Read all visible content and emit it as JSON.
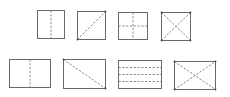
{
  "diagram": {
    "stroke_color": "#6a6a6a",
    "dash_color": "#7a7a7a",
    "shapes": [
      {
        "id": "square-vertical-fold",
        "row": 1,
        "x": 37,
        "y": 10,
        "w": 27,
        "h": 28,
        "folds": [
          [
            0.5,
            0,
            0.5,
            1
          ]
        ],
        "dots": []
      },
      {
        "id": "square-diagonal-fold",
        "row": 1,
        "x": 77,
        "y": 11,
        "w": 28,
        "h": 28,
        "folds": [
          [
            0,
            1,
            1,
            0
          ]
        ],
        "dots": [
          [
            0,
            1
          ],
          [
            1,
            0
          ]
        ]
      },
      {
        "id": "square-cross-fold",
        "row": 1,
        "x": 118,
        "y": 12,
        "w": 29,
        "h": 27,
        "folds": [
          [
            0.5,
            0,
            0.5,
            1
          ],
          [
            0,
            0.5,
            1,
            0.5
          ]
        ],
        "dots": []
      },
      {
        "id": "square-double-diagonal-fold",
        "row": 1,
        "x": 161,
        "y": 12,
        "w": 29,
        "h": 28,
        "folds": [
          [
            0,
            0,
            1,
            1
          ],
          [
            0,
            1,
            1,
            0
          ]
        ],
        "dots": [
          [
            0,
            0
          ],
          [
            1,
            0
          ],
          [
            0,
            1
          ],
          [
            1,
            1
          ]
        ]
      },
      {
        "id": "rect-vertical-fold",
        "row": 2,
        "x": 9,
        "y": 59,
        "w": 41,
        "h": 28,
        "folds": [
          [
            0.5,
            0,
            0.5,
            1
          ]
        ],
        "dots": []
      },
      {
        "id": "rect-diagonal-fold",
        "row": 2,
        "x": 63,
        "y": 59,
        "w": 42,
        "h": 29,
        "folds": [
          [
            0,
            0,
            1,
            1
          ]
        ],
        "dots": [
          [
            0,
            0
          ],
          [
            1,
            1
          ]
        ]
      },
      {
        "id": "rect-three-horizontal-folds",
        "row": 2,
        "x": 118,
        "y": 60,
        "w": 43,
        "h": 28,
        "folds": [
          [
            0,
            0.25,
            1,
            0.25
          ],
          [
            0,
            0.5,
            1,
            0.5
          ],
          [
            0,
            0.75,
            1,
            0.75
          ]
        ],
        "dots": []
      },
      {
        "id": "rect-double-diagonal-fold",
        "row": 2,
        "x": 174,
        "y": 61,
        "w": 41,
        "h": 28,
        "folds": [
          [
            0,
            0,
            1,
            1
          ],
          [
            0,
            1,
            1,
            0
          ]
        ],
        "dots": [
          [
            0,
            0
          ],
          [
            1,
            0
          ],
          [
            0,
            1
          ],
          [
            1,
            1
          ]
        ]
      }
    ]
  }
}
